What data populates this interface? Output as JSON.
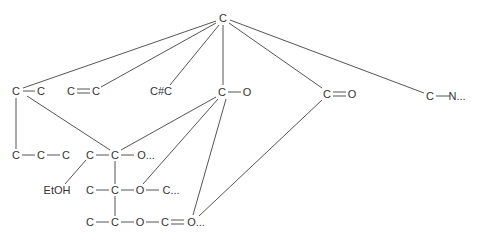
{
  "diagram": {
    "colors": {
      "line": "#555555",
      "text": "#333333",
      "background": "#ffffff"
    },
    "nodes": [
      {
        "id": "root",
        "x": 223,
        "y": 18,
        "label": "C"
      },
      {
        "id": "a1",
        "x": 16,
        "y": 91,
        "label": "C"
      },
      {
        "id": "a2",
        "x": 41,
        "y": 91,
        "label": "C"
      },
      {
        "id": "b1",
        "x": 71,
        "y": 91,
        "label": "C"
      },
      {
        "id": "b2",
        "x": 96,
        "y": 91,
        "label": "C"
      },
      {
        "id": "t1",
        "x": 161,
        "y": 91,
        "label": "C#C"
      },
      {
        "id": "co1",
        "x": 222,
        "y": 92,
        "label": "C"
      },
      {
        "id": "co2",
        "x": 247,
        "y": 92,
        "label": "O"
      },
      {
        "id": "cd1",
        "x": 327,
        "y": 94,
        "label": "C"
      },
      {
        "id": "cd2",
        "x": 352,
        "y": 94,
        "label": "O"
      },
      {
        "id": "cn1",
        "x": 430,
        "y": 96,
        "label": "C"
      },
      {
        "id": "cn2",
        "x": 457,
        "y": 96,
        "label": "N..."
      },
      {
        "id": "p1",
        "x": 16,
        "y": 155,
        "label": "C"
      },
      {
        "id": "p2",
        "x": 41,
        "y": 155,
        "label": "C"
      },
      {
        "id": "p3",
        "x": 66,
        "y": 155,
        "label": "C"
      },
      {
        "id": "r1",
        "x": 90,
        "y": 155,
        "label": "C"
      },
      {
        "id": "r2",
        "x": 115,
        "y": 155,
        "label": "C"
      },
      {
        "id": "r3",
        "x": 146,
        "y": 155,
        "label": "O..."
      },
      {
        "id": "etoh",
        "x": 57,
        "y": 190,
        "label": "EtOH"
      },
      {
        "id": "s1",
        "x": 90,
        "y": 190,
        "label": "C"
      },
      {
        "id": "s2",
        "x": 115,
        "y": 190,
        "label": "C"
      },
      {
        "id": "s3",
        "x": 140,
        "y": 190,
        "label": "O"
      },
      {
        "id": "s4",
        "x": 171,
        "y": 190,
        "label": "C..."
      },
      {
        "id": "u1",
        "x": 90,
        "y": 222,
        "label": "C"
      },
      {
        "id": "u2",
        "x": 115,
        "y": 222,
        "label": "C"
      },
      {
        "id": "u3",
        "x": 140,
        "y": 222,
        "label": "O"
      },
      {
        "id": "u4",
        "x": 165,
        "y": 222,
        "label": "C"
      },
      {
        "id": "u5",
        "x": 196,
        "y": 222,
        "label": "O..."
      }
    ],
    "edges": [
      {
        "x1": 216,
        "y1": 21,
        "x2": 23,
        "y2": 88
      },
      {
        "x1": 216,
        "y1": 23,
        "x2": 101,
        "y2": 87
      },
      {
        "x1": 219,
        "y1": 25,
        "x2": 170,
        "y2": 85
      },
      {
        "x1": 223,
        "y1": 25,
        "x2": 223,
        "y2": 85
      },
      {
        "x1": 229,
        "y1": 23,
        "x2": 322,
        "y2": 88
      },
      {
        "x1": 230,
        "y1": 20,
        "x2": 424,
        "y2": 93
      },
      {
        "x1": 23,
        "y1": 91,
        "x2": 35,
        "y2": 91
      },
      {
        "x1": 77,
        "y1": 89,
        "x2": 90,
        "y2": 89
      },
      {
        "x1": 77,
        "y1": 93,
        "x2": 90,
        "y2": 93
      },
      {
        "x1": 228,
        "y1": 92,
        "x2": 241,
        "y2": 92
      },
      {
        "x1": 333,
        "y1": 92,
        "x2": 346,
        "y2": 92
      },
      {
        "x1": 333,
        "y1": 96,
        "x2": 346,
        "y2": 96
      },
      {
        "x1": 436,
        "y1": 96,
        "x2": 450,
        "y2": 96
      },
      {
        "x1": 16,
        "y1": 98,
        "x2": 16,
        "y2": 149
      },
      {
        "x1": 27,
        "y1": 96,
        "x2": 110,
        "y2": 150
      },
      {
        "x1": 22,
        "y1": 155,
        "x2": 35,
        "y2": 155
      },
      {
        "x1": 47,
        "y1": 155,
        "x2": 60,
        "y2": 155
      },
      {
        "x1": 96,
        "y1": 155,
        "x2": 109,
        "y2": 155
      },
      {
        "x1": 121,
        "y1": 155,
        "x2": 134,
        "y2": 155
      },
      {
        "x1": 216,
        "y1": 97,
        "x2": 121,
        "y2": 150
      },
      {
        "x1": 218,
        "y1": 99,
        "x2": 143,
        "y2": 184
      },
      {
        "x1": 226,
        "y1": 99,
        "x2": 193,
        "y2": 215
      },
      {
        "x1": 322,
        "y1": 100,
        "x2": 199,
        "y2": 216
      },
      {
        "x1": 86,
        "y1": 160,
        "x2": 65,
        "y2": 184
      },
      {
        "x1": 115,
        "y1": 161,
        "x2": 115,
        "y2": 184
      },
      {
        "x1": 115,
        "y1": 196,
        "x2": 115,
        "y2": 216
      },
      {
        "x1": 96,
        "y1": 190,
        "x2": 109,
        "y2": 190
      },
      {
        "x1": 121,
        "y1": 190,
        "x2": 134,
        "y2": 190
      },
      {
        "x1": 146,
        "y1": 190,
        "x2": 159,
        "y2": 190
      },
      {
        "x1": 96,
        "y1": 222,
        "x2": 109,
        "y2": 222
      },
      {
        "x1": 121,
        "y1": 222,
        "x2": 134,
        "y2": 222
      },
      {
        "x1": 146,
        "y1": 222,
        "x2": 159,
        "y2": 222
      },
      {
        "x1": 171,
        "y1": 220,
        "x2": 184,
        "y2": 220
      },
      {
        "x1": 171,
        "y1": 224,
        "x2": 184,
        "y2": 224
      }
    ]
  }
}
